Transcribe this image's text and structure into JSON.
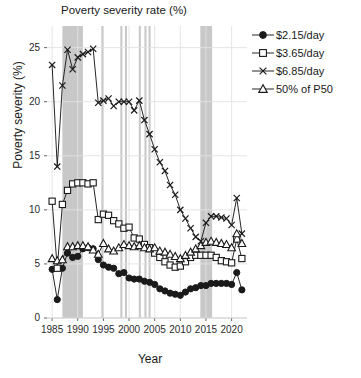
{
  "chart_data": {
    "type": "line",
    "title": "Poverty severity rate (%)",
    "xlabel": "Year",
    "ylabel": "Poverty severity (%)",
    "xlim": [
      1984,
      2023
    ],
    "ylim": [
      0,
      27
    ],
    "yticks": [
      0,
      5,
      10,
      15,
      20,
      25
    ],
    "xticks": [
      1985,
      1990,
      1995,
      2000,
      2005,
      2010,
      2015,
      2020
    ],
    "grid": true,
    "legend_position": "top-right",
    "x": [
      1985,
      1986,
      1987,
      1988,
      1989,
      1990,
      1991,
      1992,
      1993,
      1994,
      1995,
      1996,
      1997,
      1998,
      1999,
      2000,
      2001,
      2002,
      2003,
      2004,
      2005,
      2006,
      2007,
      2008,
      2009,
      2010,
      2011,
      2012,
      2013,
      2014,
      2015,
      2016,
      2017,
      2018,
      2019,
      2020,
      2021,
      2022
    ],
    "series": [
      {
        "name": "$2.15/day",
        "marker": "filled-circle",
        "color": "#1a1a1a",
        "values": [
          4.5,
          1.7,
          4.6,
          6.0,
          5.6,
          5.7,
          6.4,
          6.5,
          6.4,
          5.4,
          4.9,
          4.7,
          4.6,
          4.1,
          4.2,
          3.7,
          3.6,
          3.6,
          3.4,
          3.3,
          3.1,
          2.7,
          2.5,
          2.3,
          2.2,
          2.1,
          2.4,
          2.7,
          2.8,
          3.0,
          3.0,
          3.2,
          3.2,
          3.2,
          3.2,
          3.1,
          4.2,
          2.6
        ]
      },
      {
        "name": "$3.65/day",
        "marker": "open-square",
        "color": "#1a1a1a",
        "values": [
          10.8,
          4.6,
          10.5,
          11.8,
          12.4,
          12.5,
          12.5,
          12.4,
          12.5,
          9.1,
          9.6,
          9.5,
          9.0,
          8.7,
          8.3,
          8.4,
          7.4,
          7.3,
          6.8,
          6.5,
          6.0,
          5.6,
          5.2,
          4.9,
          4.7,
          4.8,
          5.2,
          5.6,
          5.8,
          5.8,
          5.8,
          5.8,
          5.6,
          5.3,
          5.2,
          5.1,
          7.3,
          5.5
        ]
      },
      {
        "name": "$6.85/day",
        "marker": "x",
        "color": "#1a1a1a",
        "values": [
          23.4,
          14.0,
          21.5,
          24.8,
          23.0,
          24.1,
          24.4,
          24.6,
          24.9,
          19.9,
          20.1,
          20.3,
          19.6,
          20.0,
          20.0,
          20.0,
          19.2,
          20.1,
          18.3,
          17.0,
          15.6,
          14.4,
          13.6,
          12.3,
          11.4,
          10.0,
          9.2,
          8.3,
          7.5,
          7.1,
          8.8,
          9.4,
          9.4,
          9.3,
          9.2,
          8.6,
          11.1,
          7.8
        ]
      },
      {
        "name": "50% of P50",
        "marker": "open-triangle",
        "color": "#1a1a1a",
        "values": [
          5.5,
          5.3,
          5.4,
          6.6,
          6.6,
          6.7,
          6.7,
          6.6,
          6.3,
          5.9,
          6.9,
          6.4,
          6.2,
          6.5,
          6.8,
          6.7,
          6.6,
          6.7,
          6.5,
          6.4,
          6.5,
          6.2,
          6.1,
          5.9,
          5.7,
          5.5,
          5.8,
          6.1,
          6.4,
          6.7,
          7.0,
          7.1,
          7.0,
          6.9,
          6.8,
          6.5,
          7.8,
          6.9
        ]
      }
    ],
    "shaded_bands": [
      {
        "start": 1987.0,
        "end": 1991.0
      },
      {
        "start": 1994.6,
        "end": 1995.1
      },
      {
        "start": 1998.3,
        "end": 1998.7
      },
      {
        "start": 1999.2,
        "end": 1999.6
      },
      {
        "start": 2001.9,
        "end": 2002.3
      },
      {
        "start": 2003.0,
        "end": 2003.4
      },
      {
        "start": 2003.8,
        "end": 2004.2
      },
      {
        "start": 2013.9,
        "end": 2016.2
      }
    ],
    "band_color": "#c8c8c8"
  },
  "legend": {
    "items": [
      {
        "label": "$2.15/day"
      },
      {
        "label": "$3.65/day"
      },
      {
        "label": "$6.85/day"
      },
      {
        "label": "50% of P50"
      }
    ]
  }
}
